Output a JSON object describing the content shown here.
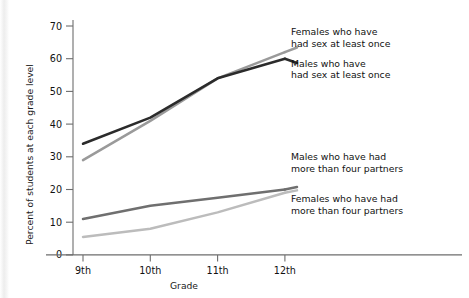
{
  "chart_data": {
    "type": "line",
    "title": "",
    "xlabel": "Grade",
    "ylabel": "Percent of students at each grade level",
    "categories": [
      "9th",
      "10th",
      "11th",
      "12th"
    ],
    "ylim": [
      0,
      75
    ],
    "yticks": [
      0,
      10,
      20,
      30,
      40,
      50,
      60,
      70
    ],
    "ytick_labels": [
      "0",
      "10",
      "20",
      "30",
      "40",
      "50",
      "60",
      "70"
    ],
    "grid": false,
    "legend_position": "inline-annotations-right",
    "series": [
      {
        "name": "Males who have had sex at least once",
        "color": "#2b2b2b",
        "values": [
          34,
          42,
          54,
          60
        ]
      },
      {
        "name": "Females who have had sex at least once",
        "color": "#9a9a9a",
        "values": [
          29,
          41,
          54,
          62
        ]
      },
      {
        "name": "Males who have had more than four partners",
        "color": "#6f6f6f",
        "values": [
          11,
          15,
          17.5,
          20
        ]
      },
      {
        "name": "Females who have had more than four partners",
        "color": "#bcbcbc",
        "values": [
          5.5,
          8,
          13,
          19
        ]
      }
    ],
    "annotations": [
      {
        "id": "females-sex-once",
        "line1": "Females who have",
        "line2": "had sex at least once"
      },
      {
        "id": "males-sex-once",
        "line1": "Males who have",
        "line2": "had sex at least once"
      },
      {
        "id": "males-four-partners",
        "line1": "Males who have had",
        "line2": "more than four partners"
      },
      {
        "id": "females-four-partners",
        "line1": "Females who have had",
        "line2": "more than four partners"
      }
    ]
  }
}
